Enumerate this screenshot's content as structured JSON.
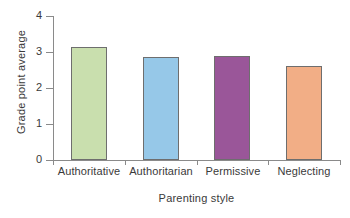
{
  "chart_data": {
    "type": "bar",
    "title": "",
    "subtitle": "",
    "xlabel": "Parenting style",
    "ylabel": "Grade point average",
    "categories": [
      "Authoritative",
      "Authoritarian",
      "Permissive",
      "Neglecting"
    ],
    "values": [
      3.15,
      2.85,
      2.9,
      2.6
    ],
    "series": [
      {
        "name": "Grade point average",
        "values": [
          3.15,
          2.85,
          2.9,
          2.6
        ]
      }
    ],
    "bar_colors": [
      "#c9dfae",
      "#96c8e8",
      "#9a5699",
      "#f2ae86"
    ],
    "bar_edge_color": "#6e6e6e",
    "axis_color": "#8a8a8a",
    "text_color": "#3a3a3a",
    "ylim": [
      0,
      4
    ],
    "ytick_labels": [
      "4",
      "3",
      "2",
      "1",
      "0"
    ],
    "ytick_values": [
      4,
      3,
      2,
      1,
      0
    ],
    "grid": false,
    "legend": false,
    "legend_position": "none"
  },
  "figure": {
    "background": "#ffffff"
  }
}
